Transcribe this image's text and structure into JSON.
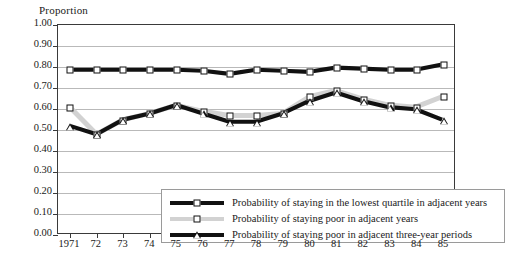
{
  "chart_data": {
    "type": "line",
    "title": "",
    "ylabel": "Proportion",
    "xlabel": "",
    "ylim": [
      0.0,
      1.0
    ],
    "ytick_labels": [
      "1.00",
      "0.90",
      "0.80",
      "0.70",
      "0.60",
      "0.50",
      "0.40",
      "0.30",
      "0.20",
      "0.10",
      "0.00"
    ],
    "ytick_values": [
      1.0,
      0.9,
      0.8,
      0.7,
      0.6,
      0.5,
      0.4,
      0.3,
      0.2,
      0.1,
      0.0
    ],
    "grid": "horizontal",
    "legend_position": "inside-bottom-center",
    "categories": [
      "1971",
      "72",
      "73",
      "74",
      "75",
      "76",
      "77",
      "78",
      "79",
      "80",
      "81",
      "82",
      "83",
      "84",
      "85"
    ],
    "x": [
      1971,
      1972,
      1973,
      1974,
      1975,
      1976,
      1977,
      1978,
      1979,
      1980,
      1981,
      1982,
      1983,
      1984,
      1985
    ],
    "series": [
      {
        "name": "Probability of staying in the lowest quartile in adjacent years",
        "marker": "square",
        "color": "#111111",
        "values": [
          0.785,
          0.785,
          0.785,
          0.785,
          0.785,
          0.78,
          0.765,
          0.785,
          0.78,
          0.775,
          0.795,
          0.79,
          0.785,
          0.785,
          0.81
        ]
      },
      {
        "name": "Probability of staying poor in adjacent years",
        "marker": "square",
        "color": "#d2d2d2",
        "values": [
          0.605,
          0.475,
          0.545,
          0.575,
          0.615,
          0.585,
          0.565,
          0.565,
          0.575,
          0.655,
          0.685,
          0.645,
          0.615,
          0.605,
          0.655
        ]
      },
      {
        "name": "Probability of staying poor in adjacent three-year periods",
        "marker": "triangle",
        "color": "#111111",
        "values": [
          0.515,
          0.475,
          0.545,
          0.575,
          0.615,
          0.575,
          0.535,
          0.535,
          0.575,
          0.635,
          0.675,
          0.635,
          0.605,
          0.595,
          0.545
        ]
      }
    ]
  },
  "legend": {
    "entries": [
      "Probability of staying in the lowest quartile in adjacent years",
      "Probability of staying poor in adjacent years",
      "Probability of staying poor in adjacent three-year periods"
    ]
  }
}
